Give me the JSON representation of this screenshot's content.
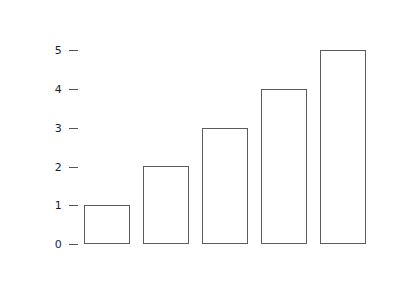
{
  "chart_data": {
    "type": "bar",
    "title": "",
    "subtitle": "",
    "xlabel": "",
    "ylabel": "",
    "categories": [
      "",
      "",
      "",
      "",
      ""
    ],
    "values": [
      1,
      2,
      3,
      4,
      5
    ],
    "ylim": [
      0,
      5
    ],
    "yticks": [
      "0",
      "1",
      "2",
      "3",
      "4",
      "5"
    ],
    "xticks": [],
    "grid": false,
    "legend": false,
    "legend_position": "none",
    "annotations": [],
    "colors": {
      "background": "#ffffff",
      "bar_fill": "#ffffff",
      "bar_stroke": "#5c5c5c",
      "tick_mark": "#555555",
      "tick_label": "#1c1c1c"
    }
  },
  "layout": {
    "bar_left_positions": [
      84,
      143,
      202,
      261,
      320
    ],
    "bar_width": 46,
    "baseline_y": 244,
    "unit_height": 38.8,
    "tick_y_positions": [
      244,
      205,
      167,
      128,
      89,
      50
    ]
  }
}
